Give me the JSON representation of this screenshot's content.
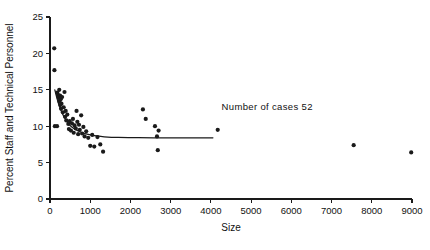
{
  "chart_data": {
    "type": "scatter",
    "title": "",
    "xlabel": "Size",
    "ylabel": "Percent Staff and Technical Personnel",
    "xlim": [
      0,
      9000
    ],
    "ylim": [
      0,
      25
    ],
    "xticks": [
      0,
      1000,
      2000,
      3000,
      4000,
      5000,
      6000,
      7000,
      8000,
      9000
    ],
    "xtick_labels": [
      "0",
      "1000",
      "2000",
      "3000",
      "4000",
      "5000",
      "6000",
      "7000",
      "8000",
      "9000"
    ],
    "yticks": [
      0,
      5,
      10,
      15,
      20,
      25
    ],
    "ytick_labels": [
      "0",
      "5",
      "10",
      "15",
      "20",
      "25"
    ],
    "grid": false,
    "legend": false,
    "marker_color": "#1a1a1a",
    "curve_color": "#1a1a1a",
    "annotations": [
      {
        "name": "number-of-cases",
        "text": "Number of cases  52",
        "x": 5400,
        "y": 12.2
      }
    ],
    "series": [
      {
        "name": "organizations",
        "points": [
          [
            105,
            20.7
          ],
          [
            110,
            17.7
          ],
          [
            120,
            10.0
          ],
          [
            175,
            10.0
          ],
          [
            180,
            14.6
          ],
          [
            200,
            14.3
          ],
          [
            215,
            13.9
          ],
          [
            230,
            15.0
          ],
          [
            235,
            13.4
          ],
          [
            250,
            14.2
          ],
          [
            255,
            12.9
          ],
          [
            265,
            13.7
          ],
          [
            275,
            12.4
          ],
          [
            285,
            13.1
          ],
          [
            300,
            14.0
          ],
          [
            320,
            11.9
          ],
          [
            340,
            12.6
          ],
          [
            360,
            14.7
          ],
          [
            375,
            11.3
          ],
          [
            390,
            12.1
          ],
          [
            405,
            10.8
          ],
          [
            430,
            11.6
          ],
          [
            455,
            10.3
          ],
          [
            470,
            9.6
          ],
          [
            490,
            10.7
          ],
          [
            520,
            9.4
          ],
          [
            545,
            10.4
          ],
          [
            570,
            11.0
          ],
          [
            590,
            9.1
          ],
          [
            610,
            10.1
          ],
          [
            640,
            9.7
          ],
          [
            660,
            12.1
          ],
          [
            680,
            10.6
          ],
          [
            700,
            8.9
          ],
          [
            720,
            10.2
          ],
          [
            740,
            9.5
          ],
          [
            775,
            11.5
          ],
          [
            800,
            9.0
          ],
          [
            830,
            9.9
          ],
          [
            860,
            8.6
          ],
          [
            900,
            9.3
          ],
          [
            950,
            8.4
          ],
          [
            1000,
            7.3
          ],
          [
            1050,
            8.8
          ],
          [
            1100,
            7.2
          ],
          [
            1180,
            8.5
          ],
          [
            1250,
            7.5
          ],
          [
            1320,
            6.5
          ],
          [
            2310,
            12.3
          ],
          [
            2380,
            11.0
          ],
          [
            2610,
            10.0
          ],
          [
            2660,
            8.6
          ],
          [
            2700,
            9.4
          ],
          [
            2680,
            6.7
          ],
          [
            4170,
            9.5
          ],
          [
            7550,
            7.4
          ],
          [
            8980,
            6.4
          ]
        ]
      }
    ],
    "fit_curve": {
      "name": "fitted-decay-curve",
      "points": [
        [
          120,
          15.0
        ],
        [
          170,
          13.9
        ],
        [
          230,
          12.8
        ],
        [
          300,
          11.8
        ],
        [
          390,
          10.9
        ],
        [
          500,
          10.1
        ],
        [
          620,
          9.6
        ],
        [
          760,
          9.2
        ],
        [
          920,
          8.9
        ],
        [
          1100,
          8.7
        ],
        [
          1350,
          8.55
        ],
        [
          1700,
          8.45
        ],
        [
          2200,
          8.42
        ],
        [
          2900,
          8.4
        ],
        [
          3500,
          8.4
        ],
        [
          4050,
          8.4
        ]
      ]
    }
  }
}
